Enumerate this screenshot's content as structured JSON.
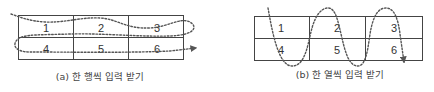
{
  "diagrams": [
    {
      "id": "a",
      "caption": "(a) 한 행씩 입력 받기",
      "order": "row-wise",
      "cells": [
        "1",
        "2",
        "3",
        "4",
        "5",
        "6"
      ],
      "rows": 2,
      "cols": 3
    },
    {
      "id": "b",
      "caption": "(b) 한 열씩 입력 받기",
      "order": "column-wise",
      "cells": [
        "1",
        "2",
        "3",
        "4",
        "5",
        "6"
      ],
      "rows": 2,
      "cols": 3
    }
  ],
  "colors": {
    "grid": "#444444",
    "path": "#555555",
    "text": "#333333"
  }
}
